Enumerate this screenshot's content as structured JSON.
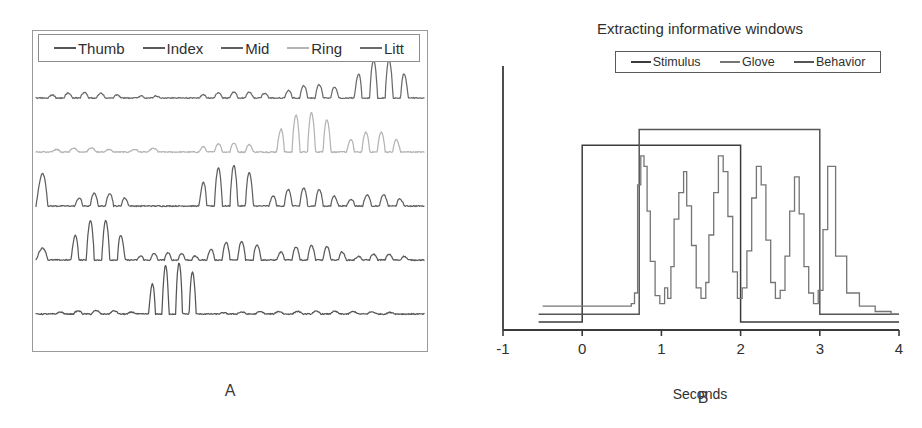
{
  "figure": {
    "panels": [
      {
        "id": "A",
        "caption": "A",
        "legend": {
          "entries": [
            {
              "label": "Thumb",
              "color": "#555555"
            },
            {
              "label": "Index",
              "color": "#5a5a5a"
            },
            {
              "label": "Mid",
              "color": "#606060"
            },
            {
              "label": "Ring",
              "color": "#b4b4b4"
            },
            {
              "label": "Litt",
              "color": "#6a6a6a"
            }
          ]
        },
        "chart_data": {
          "type": "line",
          "title": "",
          "xlabel": "",
          "ylabel": "",
          "grid": false,
          "legend_position": "top",
          "axis_visible_box": true,
          "xlim": [
            0,
            1
          ],
          "ylim": [
            0,
            1
          ],
          "description": "Five stacked glove-sensor traces, one per finger, each showing oscillatory flexion bursts at different times.",
          "series": [
            {
              "name": "Litt",
              "color": "#6a6a6a",
              "row": 0,
              "baseline_y": 0.4,
              "amplitude_scale": 1.0,
              "bursts": [
                {
                  "start": 0.03,
                  "end": 0.22,
                  "cycles": 9,
                  "amp": 0.045
                },
                {
                  "start": 0.26,
                  "end": 0.32,
                  "cycles": 3,
                  "amp": 0.022
                },
                {
                  "start": 0.42,
                  "end": 0.62,
                  "cycles": 10,
                  "amp": 0.05
                },
                {
                  "start": 0.64,
                  "end": 0.8,
                  "cycles": 8,
                  "amp": 0.11
                },
                {
                  "start": 0.82,
                  "end": 0.96,
                  "cycles": 7,
                  "amp": 0.33
                }
              ]
            },
            {
              "name": "Ring",
              "color": "#b4b4b4",
              "row": 1,
              "baseline_y": 0.4,
              "amplitude_scale": 1.0,
              "bursts": [
                {
                  "start": 0.04,
                  "end": 0.2,
                  "cycles": 7,
                  "amp": 0.035
                },
                {
                  "start": 0.24,
                  "end": 0.34,
                  "cycles": 4,
                  "amp": 0.03
                },
                {
                  "start": 0.42,
                  "end": 0.58,
                  "cycles": 8,
                  "amp": 0.075
                },
                {
                  "start": 0.62,
                  "end": 0.78,
                  "cycles": 8,
                  "amp": 0.33
                },
                {
                  "start": 0.8,
                  "end": 0.94,
                  "cycles": 7,
                  "amp": 0.17
                }
              ]
            },
            {
              "name": "Mid",
              "color": "#606060",
              "row": 2,
              "baseline_y": 0.4,
              "amplitude_scale": 1.0,
              "bursts": [
                {
                  "start": 0.0,
                  "end": 0.06,
                  "cycles": 2,
                  "amp": 0.3
                },
                {
                  "start": 0.1,
                  "end": 0.24,
                  "cycles": 7,
                  "amp": 0.11
                },
                {
                  "start": 0.42,
                  "end": 0.58,
                  "cycles": 8,
                  "amp": 0.34
                },
                {
                  "start": 0.6,
                  "end": 0.78,
                  "cycles": 9,
                  "amp": 0.15
                },
                {
                  "start": 0.8,
                  "end": 0.95,
                  "cycles": 7,
                  "amp": 0.095
                }
              ]
            },
            {
              "name": "Index",
              "color": "#5a5a5a",
              "row": 3,
              "baseline_y": 0.4,
              "amplitude_scale": 1.0,
              "bursts": [
                {
                  "start": 0.0,
                  "end": 0.06,
                  "cycles": 2,
                  "amp": 0.11
                },
                {
                  "start": 0.09,
                  "end": 0.23,
                  "cycles": 7,
                  "amp": 0.34
                },
                {
                  "start": 0.26,
                  "end": 0.42,
                  "cycles": 9,
                  "amp": 0.06
                },
                {
                  "start": 0.44,
                  "end": 0.6,
                  "cycles": 8,
                  "amp": 0.155
                },
                {
                  "start": 0.62,
                  "end": 0.8,
                  "cycles": 9,
                  "amp": 0.12
                },
                {
                  "start": 0.82,
                  "end": 0.96,
                  "cycles": 7,
                  "amp": 0.05
                }
              ]
            },
            {
              "name": "Thumb",
              "color": "#555555",
              "row": 4,
              "baseline_y": 0.4,
              "amplitude_scale": 1.0,
              "bursts": [
                {
                  "start": 0.05,
                  "end": 0.26,
                  "cycles": 9,
                  "amp": 0.028
                },
                {
                  "start": 0.29,
                  "end": 0.43,
                  "cycles": 8,
                  "amp": 0.43
                },
                {
                  "start": 0.47,
                  "end": 0.95,
                  "cycles": 20,
                  "amp": 0.022
                }
              ]
            }
          ]
        }
      },
      {
        "id": "B",
        "caption": "B",
        "title": "Extracting informative windows",
        "legend": {
          "entries": [
            {
              "label": "Stimulus",
              "color": "#3c3c3c"
            },
            {
              "label": "Glove",
              "color": "#757575"
            },
            {
              "label": "Behavior",
              "color": "#555555"
            }
          ]
        },
        "chart_data": {
          "type": "line",
          "title": "Extracting informative windows",
          "xlabel": "Seconds",
          "ylabel": "",
          "grid": false,
          "legend_position": "top",
          "xlim": [
            -1,
            4
          ],
          "xticks": [
            -1,
            0,
            1,
            2,
            3,
            4
          ],
          "xticklabels": [
            "-1",
            "0",
            "1",
            "2",
            "3",
            "4"
          ],
          "ylim": [
            0,
            1
          ],
          "yticks": [],
          "yticklabels": [],
          "series": [
            {
              "name": "Stimulus",
              "color": "#3c3c3c",
              "type": "step",
              "description": "Rectangular pulse high from 0 s to 2 s",
              "points": [
                [
                  -0.55,
                  0.03
                ],
                [
                  0.0,
                  0.03
                ],
                [
                  0.0,
                  0.7
                ],
                [
                  2.0,
                  0.7
                ],
                [
                  2.0,
                  0.03
                ],
                [
                  4.0,
                  0.03
                ]
              ]
            },
            {
              "name": "Behavior",
              "color": "#555555",
              "type": "step",
              "description": "Rectangular pulse high from 0.72 s to 3.0 s",
              "points": [
                [
                  -0.55,
                  0.06
                ],
                [
                  0.72,
                  0.06
                ],
                [
                  0.72,
                  0.76
                ],
                [
                  3.0,
                  0.76
                ],
                [
                  3.0,
                  0.06
                ],
                [
                  4.0,
                  0.06
                ]
              ]
            },
            {
              "name": "Glove",
              "color": "#757575",
              "type": "step",
              "description": "Noisy stepped flexion signal: flat low baseline until ~0.65 s, then six large flexion peaks between 0.7 s and 3.0 s, decaying back to baseline after 3.1 s",
              "x": [
                -0.5,
                -0.3,
                -0.1,
                0.1,
                0.3,
                0.5,
                0.62,
                0.66,
                0.7,
                0.74,
                0.78,
                0.82,
                0.86,
                0.92,
                0.98,
                1.04,
                1.08,
                1.12,
                1.16,
                1.22,
                1.28,
                1.32,
                1.38,
                1.44,
                1.5,
                1.56,
                1.6,
                1.66,
                1.72,
                1.78,
                1.84,
                1.9,
                1.96,
                2.02,
                2.08,
                2.14,
                2.2,
                2.26,
                2.32,
                2.38,
                2.44,
                2.5,
                2.56,
                2.62,
                2.68,
                2.74,
                2.8,
                2.86,
                2.92,
                2.98,
                3.04,
                3.1,
                3.2,
                3.34,
                3.5,
                3.7,
                3.9,
                4.0
              ],
              "y": [
                0.09,
                0.09,
                0.09,
                0.09,
                0.09,
                0.09,
                0.1,
                0.14,
                0.55,
                0.66,
                0.62,
                0.45,
                0.26,
                0.13,
                0.1,
                0.16,
                0.12,
                0.24,
                0.42,
                0.52,
                0.6,
                0.47,
                0.32,
                0.16,
                0.12,
                0.18,
                0.36,
                0.52,
                0.66,
                0.6,
                0.43,
                0.22,
                0.12,
                0.16,
                0.3,
                0.5,
                0.62,
                0.55,
                0.34,
                0.18,
                0.12,
                0.15,
                0.28,
                0.45,
                0.58,
                0.44,
                0.24,
                0.14,
                0.1,
                0.15,
                0.38,
                0.62,
                0.28,
                0.14,
                0.09,
                0.07,
                0.06,
                0.06
              ]
            }
          ]
        }
      }
    ]
  }
}
